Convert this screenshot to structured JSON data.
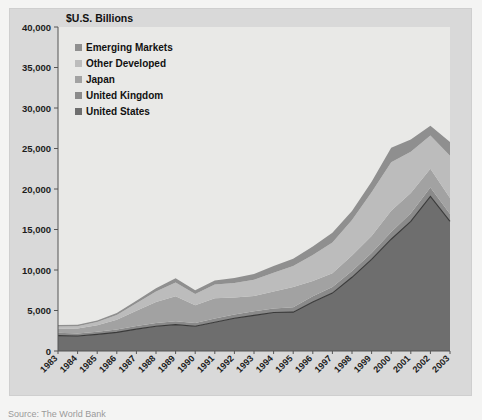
{
  "chart_data": {
    "type": "area",
    "stacked": true,
    "title": "$U.S. Billions",
    "xlabel": "",
    "ylabel": "",
    "ylim": [
      0,
      40000
    ],
    "ytick_step": 5000,
    "ytick_labels": [
      "0",
      "5,000",
      "10,000",
      "15,000",
      "20,000",
      "25,000",
      "30,000",
      "35,000",
      "40,000"
    ],
    "ytick_values": [
      0,
      5000,
      10000,
      15000,
      20000,
      25000,
      30000,
      35000,
      40000
    ],
    "grid": false,
    "legend_position": "top-left",
    "x_label_rotation": -45,
    "categories": [
      "1983",
      "1984",
      "1985",
      "1986",
      "1987",
      "1988",
      "1989",
      "1990",
      "1991",
      "1992",
      "1993",
      "1994",
      "1995",
      "1996",
      "1997",
      "1998",
      "1999",
      "2000",
      "2001",
      "2002",
      "2003"
    ],
    "series": [
      {
        "name": "United States",
        "color": "#6e6e6e",
        "values": [
          1900,
          1850,
          2050,
          2300,
          2700,
          3050,
          3250,
          3050,
          3550,
          4050,
          4400,
          4750,
          4800,
          6050,
          7150,
          9100,
          11300,
          13800,
          16000,
          19100,
          16000
        ]
      },
      {
        "name": "United Kingdom",
        "color": "#8a8a8a",
        "values": [
          350,
          320,
          330,
          350,
          380,
          400,
          420,
          400,
          450,
          450,
          500,
          500,
          600,
          700,
          750,
          780,
          800,
          900,
          1000,
          1100,
          900
        ]
      },
      {
        "name": "Japan",
        "color": "#a2a2a2",
        "values": [
          500,
          600,
          800,
          1200,
          1900,
          2600,
          3100,
          2200,
          2500,
          2100,
          1900,
          2100,
          2500,
          1900,
          1700,
          1900,
          2100,
          2600,
          2500,
          2300,
          2000
        ]
      },
      {
        "name": "Other Developed",
        "color": "#bcbcbc",
        "values": [
          280,
          300,
          400,
          600,
          900,
          1300,
          1700,
          1400,
          1700,
          1800,
          2000,
          2300,
          2600,
          3200,
          3800,
          4400,
          5400,
          6000,
          5100,
          4100,
          5200
        ]
      },
      {
        "name": "Emerging Markets",
        "color": "#8f8f8f",
        "values": [
          170,
          180,
          200,
          250,
          320,
          400,
          500,
          450,
          500,
          600,
          700,
          850,
          900,
          1050,
          1200,
          1100,
          1300,
          1800,
          1500,
          1200,
          1700
        ]
      }
    ],
    "series_order_bottom_to_top": [
      "United States",
      "United Kingdom",
      "Japan",
      "Other Developed",
      "Emerging Markets"
    ],
    "totals": [
      3200,
      3250,
      3780,
      4700,
      6200,
      7750,
      8970,
      7500,
      8700,
      9000,
      9500,
      10500,
      11400,
      12900,
      14600,
      17280,
      20900,
      25100,
      26100,
      27800,
      25800
    ],
    "annotation_line": {
      "name": "united-states-boundary-line",
      "color": "#3a3a3a",
      "note": "dark boundary stroke along top of United States band"
    }
  },
  "legend": {
    "items": [
      {
        "label": "Emerging Markets",
        "color": "#8f8f8f",
        "swatch": "legend-swatch-emerging-markets"
      },
      {
        "label": "Other Developed",
        "color": "#bcbcbc",
        "swatch": "legend-swatch-other-developed"
      },
      {
        "label": "Japan",
        "color": "#a2a2a2",
        "swatch": "legend-swatch-japan"
      },
      {
        "label": "United Kingdom",
        "color": "#8a8a8a",
        "swatch": "legend-swatch-united-kingdom"
      },
      {
        "label": "United States",
        "color": "#6e6e6e",
        "swatch": "legend-swatch-united-states"
      }
    ]
  },
  "caption": {
    "text": "Source: The World Bank"
  },
  "colors": {
    "page_background": "#f4f4f3",
    "frame_background": "#d9d9d9",
    "plot_background": "#e8e8e6",
    "axis": "#4a4a4a",
    "text": "#1c1c1c"
  }
}
